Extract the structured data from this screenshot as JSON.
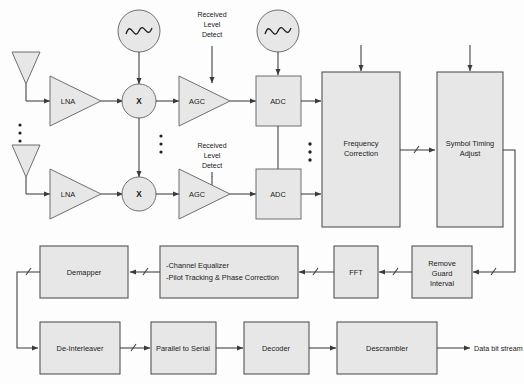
{
  "diagram": {
    "colors": {
      "block_fill": "#e7e7e7",
      "block_stroke": "#6f6f6f",
      "wire": "#3a3a3a",
      "background": "#fdfdfd",
      "text": "#1a1a1a"
    }
  },
  "rf_chain": {
    "branch_top": {
      "antenna": "antenna",
      "lna": "LNA",
      "mixer": "X",
      "oscillator": "local-oscillator",
      "agc": "AGC",
      "adc": "ADC",
      "level_detect_line1": "Received",
      "level_detect_line2": "Level",
      "level_detect_line3": "Detect"
    },
    "branch_bottom": {
      "antenna": "antenna",
      "lna": "LNA",
      "mixer": "X",
      "oscillator": "local-oscillator",
      "agc": "AGC",
      "adc": "ADC",
      "level_detect_line1": "Received",
      "level_detect_line2": "Level",
      "level_detect_line3": "Detect"
    },
    "ellipsis": "⋮"
  },
  "blocks": {
    "frequency_correction_line1": "Frequency",
    "frequency_correction_line2": "Correction",
    "symbol_timing_line1": "Symbol Timing",
    "symbol_timing_line2": "Adjust",
    "remove_guard_line1": "Remove",
    "remove_guard_line2": "Guard",
    "remove_guard_line3": "Interval",
    "fft": "FFT",
    "equalizer_line1": "-Channel Equalizer",
    "equalizer_line2": "-Pilot Tracking & Phase Correction",
    "demapper": "Demapper",
    "deinterleaver": "De-Interleaver",
    "parallel_to_serial": "Parallel to Serial",
    "decoder": "Decoder",
    "descrambler": "Descrambler"
  },
  "outputs": {
    "data_bit_stream": "Data bit stream"
  }
}
